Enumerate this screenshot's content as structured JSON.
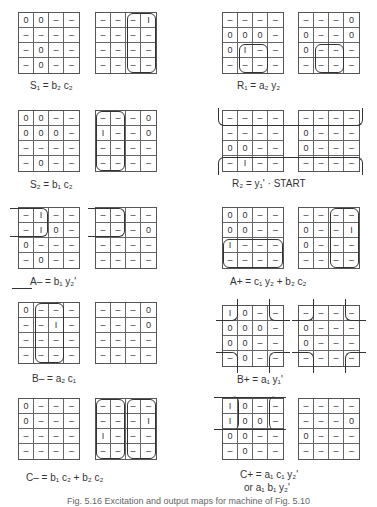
{
  "figure": {
    "caption": "Fig. 5.16 Excitation and output maps for machine of Fig. 5.10",
    "panels": [
      {
        "id": "S1",
        "label": "S1 = b2 c2",
        "maps": [
          [
            [
              "0",
              "0",
              "–",
              "–"
            ],
            [
              "–",
              "–",
              "–",
              "–"
            ],
            [
              "–",
              "0",
              "–",
              "–"
            ],
            [
              "–",
              "0",
              "–",
              "–"
            ]
          ],
          [
            [
              "–",
              "–",
              "–",
              "1"
            ],
            [
              "–",
              "–",
              "–",
              "–"
            ],
            [
              "–",
              "–",
              "–",
              "–"
            ],
            [
              "–",
              "–",
              "–",
              "–"
            ]
          ]
        ]
      },
      {
        "id": "R1",
        "label": "R1 = a2 y2",
        "maps": [
          [
            [
              "–",
              "–",
              "–",
              "–"
            ],
            [
              "0",
              "0",
              "0",
              "–"
            ],
            [
              "0",
              "1",
              "–",
              "–"
            ],
            [
              "–",
              "–",
              "–",
              "–"
            ]
          ],
          [
            [
              "–",
              "–",
              "–",
              "0"
            ],
            [
              "0",
              "–",
              "–",
              "0"
            ],
            [
              "0",
              "–",
              "–",
              "–"
            ],
            [
              "–",
              "–",
              "–",
              "–"
            ]
          ]
        ]
      },
      {
        "id": "S2",
        "label": "S2 = b1 c2",
        "maps": [
          [
            [
              "0",
              "0",
              "–",
              "–"
            ],
            [
              "0",
              "0",
              "0",
              "–"
            ],
            [
              "–",
              "–",
              "–",
              "–"
            ],
            [
              "–",
              "0",
              "–",
              "–"
            ]
          ],
          [
            [
              "–",
              "–",
              "–",
              "0"
            ],
            [
              "1",
              "–",
              "–",
              "0"
            ],
            [
              "–",
              "–",
              "–",
              "–"
            ],
            [
              "–",
              "–",
              "–",
              "–"
            ]
          ]
        ]
      },
      {
        "id": "R2",
        "label": "R2 = y1' · START",
        "maps": [
          [
            [
              "–",
              "–",
              "–",
              "–"
            ],
            [
              "–",
              "–",
              "–",
              "–"
            ],
            [
              "0",
              "0",
              "–",
              "–"
            ],
            [
              "–",
              "1",
              "–",
              "–"
            ]
          ],
          [
            [
              "–",
              "–",
              "–",
              "–"
            ],
            [
              "0",
              "–",
              "–",
              "–"
            ],
            [
              "0",
              "–",
              "–",
              "–"
            ],
            [
              "–",
              "–",
              "–",
              "–"
            ]
          ]
        ]
      },
      {
        "id": "A-",
        "label": "A– = b1 y2'",
        "maps": [
          [
            [
              "–",
              "1",
              "–",
              "–"
            ],
            [
              "–",
              "1",
              "0",
              "–"
            ],
            [
              "0",
              "–",
              "–",
              "–"
            ],
            [
              "–",
              "0",
              "–",
              "–"
            ]
          ],
          [
            [
              "–",
              "–",
              "–",
              "–"
            ],
            [
              "–",
              "–",
              "–",
              "0"
            ],
            [
              "–",
              "–",
              "–",
              "–"
            ],
            [
              "–",
              "–",
              "–",
              "–"
            ]
          ]
        ]
      },
      {
        "id": "A+",
        "label": "A+ = c1 y2 + b2 c2",
        "maps": [
          [
            [
              "0",
              "0",
              "–",
              "–"
            ],
            [
              "0",
              "0",
              "–",
              "–"
            ],
            [
              "1",
              "–",
              "–",
              "–"
            ],
            [
              "–",
              "–",
              "–",
              "–"
            ]
          ],
          [
            [
              "–",
              "–",
              "–",
              "–"
            ],
            [
              "0",
              "–",
              "–",
              "1"
            ],
            [
              "0",
              "–",
              "–",
              "–"
            ],
            [
              "–",
              "–",
              "–",
              "–"
            ]
          ]
        ]
      },
      {
        "id": "B-",
        "label": "B– = a2 c1",
        "maps": [
          [
            [
              "0",
              "–",
              "–",
              "–"
            ],
            [
              "–",
              "–",
              "1",
              "–"
            ],
            [
              "–",
              "–",
              "–",
              "–"
            ],
            [
              "–",
              "–",
              "–",
              "–"
            ]
          ],
          [
            [
              "–",
              "–",
              "–",
              "0"
            ],
            [
              "–",
              "–",
              "–",
              "0"
            ],
            [
              "–",
              "–",
              "–",
              "–"
            ],
            [
              "–",
              "–",
              "–",
              "–"
            ]
          ]
        ]
      },
      {
        "id": "B+",
        "label": "B+ = a1 y1'",
        "maps": [
          [
            [
              "1",
              "0",
              "–",
              "–"
            ],
            [
              "0",
              "0",
              "0",
              "–"
            ],
            [
              "0",
              "0",
              "–",
              "–"
            ],
            [
              "–",
              "0",
              "–",
              "–"
            ]
          ],
          [
            [
              "–",
              "–",
              "–",
              "–"
            ],
            [
              "0",
              "–",
              "–",
              "–"
            ],
            [
              "0",
              "–",
              "–",
              "–"
            ],
            [
              "–",
              "–",
              "–",
              "–"
            ]
          ]
        ]
      },
      {
        "id": "C-",
        "label": "C– = b1 c2 + b2 c2",
        "maps": [
          [
            [
              "0",
              "–",
              "–",
              "–"
            ],
            [
              "0",
              "–",
              "–",
              "–"
            ],
            [
              "–",
              "–",
              "–",
              "–"
            ],
            [
              "–",
              "–",
              "–",
              "–"
            ]
          ],
          [
            [
              "–",
              "–",
              "–",
              "–"
            ],
            [
              "–",
              "–",
              "–",
              "1"
            ],
            [
              "1",
              "–",
              "–",
              "–"
            ],
            [
              "–",
              "–",
              "–",
              "–"
            ]
          ]
        ]
      },
      {
        "id": "C+",
        "label": "C+ = a1 c1 y2'",
        "label2": "or   a1 b1 y2'",
        "maps": [
          [
            [
              "1",
              "0",
              "–",
              "–"
            ],
            [
              "1",
              "0",
              "0",
              "–"
            ],
            [
              "0",
              "0",
              "–",
              "–"
            ],
            [
              "–",
              "0",
              "–",
              "–"
            ]
          ],
          [
            [
              "–",
              "–",
              "–",
              "–"
            ],
            [
              "–",
              "–",
              "–",
              "0"
            ],
            [
              "0",
              "–",
              "–",
              "–"
            ],
            [
              "–",
              "–",
              "–",
              "–"
            ]
          ]
        ]
      }
    ]
  },
  "labels": {
    "S1": "S₁ = b₂ c₂",
    "R1": "R₁ = a₂ y₂",
    "S2": "S₂ = b₁ c₂",
    "R2": "R₂ = y₁' · START",
    "Aminus": "A– = b₁ y₂'",
    "Aplus": "A+ = c₁ y₂ + b₂ c₂",
    "Bminus": "B– = a₂ c₁",
    "Bplus": "B+ = a₁ y₁'",
    "Cminus": "C– = b₁ c₂ + b₂ c₂",
    "Cplus": "C+ = a₁ c₁ y₂'",
    "Cplus2": "or   a₁ b₁ y₂'"
  }
}
